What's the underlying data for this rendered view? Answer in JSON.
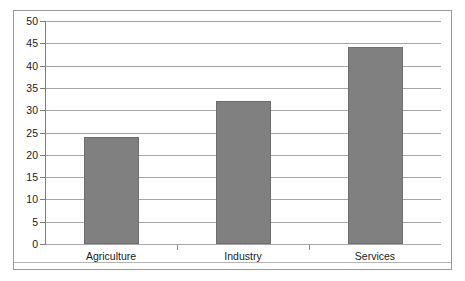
{
  "chart_data": {
    "type": "bar",
    "title": "",
    "subtitle": "",
    "xlabel": "",
    "ylabel": "",
    "categories": [
      "Agriculture",
      "Industry",
      "Services"
    ],
    "values": [
      24.1,
      32.1,
      44.1
    ],
    "series": [
      {
        "name": "",
        "values": [
          24.1,
          32.1,
          44.1
        ]
      }
    ],
    "ylim": [
      0,
      50
    ],
    "ytick_step": 5,
    "yticks": [
      0,
      5,
      10,
      15,
      20,
      25,
      30,
      35,
      40,
      45,
      50
    ],
    "ytick_labels": [
      "0",
      "5",
      "10",
      "15",
      "20",
      "25",
      "30",
      "35",
      "40",
      "45",
      "50"
    ],
    "grid": true,
    "grid_axis": "y",
    "legend": false,
    "legend_position": "none",
    "annotations": [],
    "data_labels": false,
    "colors": {
      "bar_fill": "#808080",
      "bar_stroke": "#6e6e6e",
      "gridline": "#a6a6a6",
      "axis": "#7d7d7d",
      "frame": "#9a9a9a",
      "text": "#1a1a1a",
      "background": "#ffffff"
    }
  }
}
